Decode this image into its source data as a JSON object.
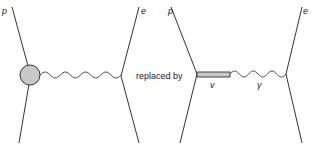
{
  "diagram": {
    "left": {
      "top_left_label": "p",
      "top_right_label": "e",
      "blob_color": "#c8c8c8",
      "propagator": "photon"
    },
    "connector_text": "replaced by",
    "right": {
      "top_left_label": "p",
      "top_right_label": "e",
      "bar_label": "v",
      "photon_label": "γ",
      "bar_color": "#c8c8c8"
    },
    "line_color": "#333333"
  }
}
